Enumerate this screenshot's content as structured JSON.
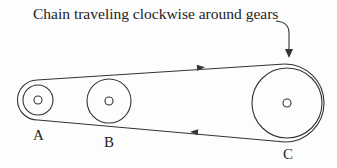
{
  "diagram": {
    "caption": "Chain traveling clockwise around gears",
    "gears": [
      {
        "label": "A",
        "cx": 38,
        "cy": 100,
        "r": 15,
        "hub_r": 4
      },
      {
        "label": "B",
        "cx": 109,
        "cy": 101,
        "r": 22,
        "hub_r": 4
      },
      {
        "label": "C",
        "cx": 287,
        "cy": 103,
        "r": 35,
        "hub_r": 4
      }
    ],
    "chain_direction": "clockwise",
    "stroke_color": "#333333"
  }
}
